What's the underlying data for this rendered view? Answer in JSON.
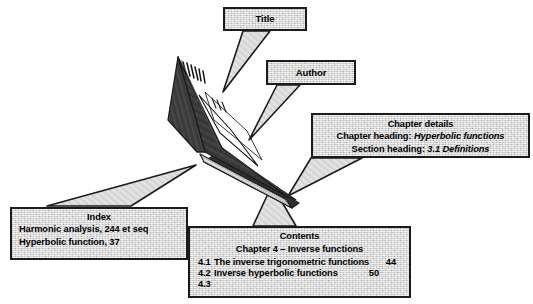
{
  "figure": {
    "kind": "labelled-diagram",
    "background_color": "#ffffff",
    "callout_fill": "#d9d9d9",
    "callout_border": "#1b1b1b",
    "book_cover_color": "#3a3a3a",
    "book_page_color": "#f2f2f2"
  },
  "callouts": {
    "title": {
      "label": "Title"
    },
    "author": {
      "label": "Author"
    },
    "chapter_details": {
      "heading": "Chapter details",
      "chapter_label": "Chapter heading:",
      "chapter_value": "Hyperbolic functions",
      "section_label": "Section heading:",
      "section_value": "3.1 Definitions"
    },
    "index": {
      "heading": "Index",
      "entries": [
        "Harmonic analysis, 244 et seq",
        "Hyperbolic function, 37"
      ]
    },
    "contents": {
      "heading": "Contents",
      "chapter_line": "Chapter 4  –  Inverse functions",
      "rows": [
        {
          "number": "4.1",
          "text": "The inverse trigonometric functions",
          "page": "44"
        },
        {
          "number": "4.2",
          "text": "Inverse hyperbolic functions",
          "page": "50"
        },
        {
          "number": "4.3",
          "text": "",
          "page": ""
        }
      ]
    }
  }
}
